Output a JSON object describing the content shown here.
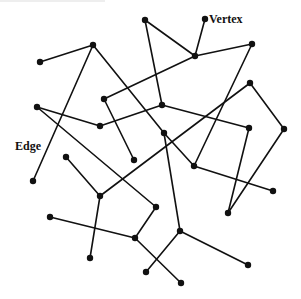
{
  "diagram": {
    "type": "graph",
    "labels": {
      "vertex": "Vertex",
      "edge": "Edge"
    },
    "colors": {
      "stroke": "#111111",
      "background": "#ffffff"
    },
    "vertices": [
      {
        "id": "v1",
        "x": 40,
        "y": 62
      },
      {
        "id": "v2",
        "x": 93,
        "y": 45
      },
      {
        "id": "v3",
        "x": 145,
        "y": 20
      },
      {
        "id": "v4",
        "x": 205,
        "y": 19
      },
      {
        "id": "v5",
        "x": 195,
        "y": 56
      },
      {
        "id": "v6",
        "x": 252,
        "y": 44
      },
      {
        "id": "v7",
        "x": 37,
        "y": 107
      },
      {
        "id": "v8",
        "x": 100,
        "y": 126
      },
      {
        "id": "v9",
        "x": 104,
        "y": 99
      },
      {
        "id": "v10",
        "x": 162,
        "y": 105
      },
      {
        "id": "v11",
        "x": 250,
        "y": 83
      },
      {
        "id": "v12",
        "x": 134,
        "y": 160
      },
      {
        "id": "v13",
        "x": 164,
        "y": 133
      },
      {
        "id": "v14",
        "x": 249,
        "y": 128
      },
      {
        "id": "v15",
        "x": 284,
        "y": 129
      },
      {
        "id": "v16",
        "x": 194,
        "y": 166
      },
      {
        "id": "v17",
        "x": 273,
        "y": 191
      },
      {
        "id": "v18",
        "x": 228,
        "y": 213
      },
      {
        "id": "v19",
        "x": 33,
        "y": 181
      },
      {
        "id": "v20",
        "x": 66,
        "y": 157
      },
      {
        "id": "v21",
        "x": 100,
        "y": 196
      },
      {
        "id": "v22",
        "x": 156,
        "y": 207
      },
      {
        "id": "v23",
        "x": 50,
        "y": 217
      },
      {
        "id": "v24",
        "x": 135,
        "y": 238
      },
      {
        "id": "v25",
        "x": 90,
        "y": 258
      },
      {
        "id": "v26",
        "x": 180,
        "y": 231
      },
      {
        "id": "v27",
        "x": 146,
        "y": 272
      },
      {
        "id": "v28",
        "x": 181,
        "y": 283
      },
      {
        "id": "v29",
        "x": 248,
        "y": 265
      }
    ],
    "edges": [
      [
        "v1",
        "v2"
      ],
      [
        "v2",
        "v19"
      ],
      [
        "v2",
        "v13"
      ],
      [
        "v13",
        "v16"
      ],
      [
        "v13",
        "v26"
      ],
      [
        "v3",
        "v5"
      ],
      [
        "v3",
        "v10"
      ],
      [
        "v4",
        "v5"
      ],
      [
        "v5",
        "v6"
      ],
      [
        "v5",
        "v9"
      ],
      [
        "v9",
        "v12"
      ],
      [
        "v7",
        "v8"
      ],
      [
        "v8",
        "v10"
      ],
      [
        "v10",
        "v14"
      ],
      [
        "v7",
        "v22"
      ],
      [
        "v11",
        "v21"
      ],
      [
        "v11",
        "v15"
      ],
      [
        "v14",
        "v18"
      ],
      [
        "v15",
        "v18"
      ],
      [
        "v6",
        "v16"
      ],
      [
        "v16",
        "v17"
      ],
      [
        "v20",
        "v21"
      ],
      [
        "v21",
        "v25"
      ],
      [
        "v23",
        "v24"
      ],
      [
        "v24",
        "v22"
      ],
      [
        "v24",
        "v28"
      ],
      [
        "v26",
        "v27"
      ],
      [
        "v26",
        "v29"
      ]
    ],
    "annotations": [
      {
        "text_key": "vertex",
        "anchor": "v4",
        "x": 209,
        "y": 23
      },
      {
        "text_key": "edge",
        "x": 15,
        "y": 150
      }
    ]
  }
}
